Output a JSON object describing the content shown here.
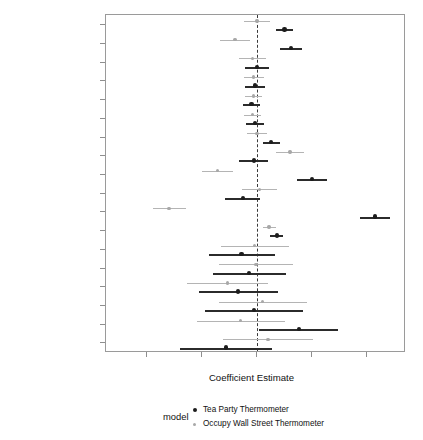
{
  "chart_data": {
    "type": "scatter",
    "subtype": "coefficient-plot",
    "title": "",
    "xlabel": "Coefficient Estimate",
    "ylabel": "",
    "xlim": [
      -1.38,
      1.36
    ],
    "xticks": [
      -1.0,
      -0.5,
      0.0,
      0.5,
      1.0
    ],
    "xticklabels": [
      "-1.0",
      "-0.5",
      "0.0",
      "0.5",
      "1.0"
    ],
    "grid": false,
    "reference_line": {
      "x": 0.0,
      "style": "dashed",
      "color": "#3a3a3a"
    },
    "legend": {
      "title": "model",
      "position": "bottom",
      "entries": [
        {
          "name": "Tea Party Thermometer",
          "color": "#1c1c1c"
        },
        {
          "name": "Occupy Wall Street Thermometer",
          "color": "#a8a8a8"
        }
      ]
    },
    "categories": [
      "Populism",
      "Anti-Immigrant",
      "Authoritarianism",
      "Age",
      "Education",
      "Income",
      "Religiosity",
      "Liberal",
      "Conservative",
      "Democrat",
      "Republican",
      "Male",
      "African American",
      "Hispanic",
      "Asian",
      "Native American",
      "Race: Other",
      "Race: Nonresponse"
    ],
    "series": [
      {
        "name": "Tea Party Thermometer",
        "color": "#1c1c1c",
        "estimates": [
          0.25,
          0.31,
          0.0,
          -0.02,
          -0.05,
          -0.02,
          0.13,
          -0.03,
          0.5,
          -0.13,
          1.07,
          0.18,
          -0.14,
          -0.07,
          -0.17,
          -0.03,
          0.38,
          -0.28
        ],
        "ci_low": [
          0.17,
          0.21,
          -0.11,
          -0.11,
          -0.13,
          -0.1,
          0.05,
          -0.16,
          0.36,
          -0.29,
          0.94,
          0.12,
          -0.44,
          -0.4,
          -0.53,
          -0.47,
          0.02,
          -0.7
        ],
        "ci_high": [
          0.33,
          0.41,
          0.11,
          0.07,
          0.03,
          0.06,
          0.21,
          0.1,
          0.64,
          0.03,
          1.21,
          0.24,
          0.16,
          0.26,
          0.19,
          0.42,
          0.74,
          0.14
        ]
      },
      {
        "name": "Occupy Wall Street Thermometer",
        "color": "#a8a8a8",
        "estimates": [
          0.0,
          -0.2,
          -0.04,
          -0.03,
          -0.03,
          -0.04,
          0.0,
          0.3,
          -0.36,
          0.02,
          -0.8,
          0.11,
          -0.02,
          -0.01,
          -0.27,
          0.05,
          -0.15,
          0.1
        ],
        "ci_low": [
          -0.12,
          -0.34,
          -0.16,
          -0.12,
          -0.11,
          -0.12,
          -0.09,
          0.17,
          -0.5,
          -0.14,
          -0.95,
          0.05,
          -0.33,
          -0.35,
          -0.64,
          -0.35,
          -0.55,
          -0.31
        ],
        "ci_high": [
          0.12,
          -0.06,
          0.08,
          0.06,
          0.05,
          0.04,
          0.09,
          0.43,
          -0.22,
          0.18,
          -0.65,
          0.17,
          0.29,
          0.33,
          0.1,
          0.45,
          0.25,
          0.51
        ]
      }
    ]
  }
}
